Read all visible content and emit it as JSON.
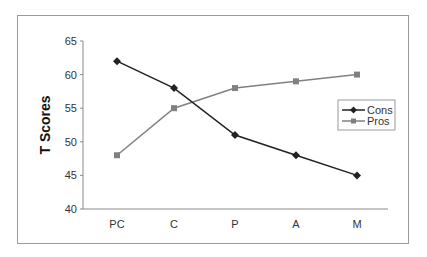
{
  "chart_data": {
    "type": "line",
    "title": "",
    "xlabel": "",
    "ylabel": "T Scores",
    "categories": [
      "PC",
      "C",
      "P",
      "A",
      "M"
    ],
    "series": [
      {
        "name": "Cons",
        "values": [
          62,
          58,
          51,
          48,
          45
        ],
        "color": "#222222",
        "marker": "diamond"
      },
      {
        "name": "Pros",
        "values": [
          48,
          55,
          58,
          59,
          60
        ],
        "color": "#808080",
        "marker": "square"
      }
    ],
    "ylim": [
      40,
      65
    ],
    "yticks": [
      40,
      45,
      50,
      55,
      60,
      65
    ],
    "grid": false,
    "legend_position": "right"
  },
  "legend": {
    "items": [
      {
        "label": "Cons"
      },
      {
        "label": "Pros"
      }
    ]
  },
  "axis": {
    "ylabel": "T Scores",
    "yticks": [
      "40",
      "45",
      "50",
      "55",
      "60",
      "65"
    ],
    "xticks": [
      "PC",
      "C",
      "P",
      "A",
      "M"
    ]
  }
}
